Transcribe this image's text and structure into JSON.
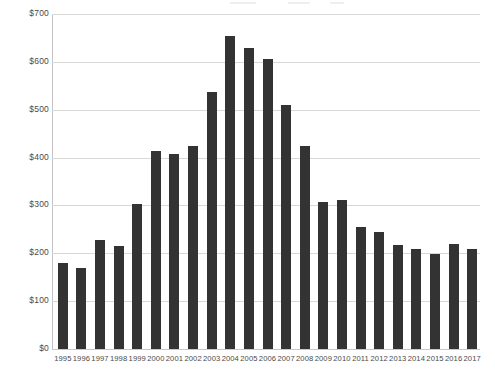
{
  "chart_data": {
    "type": "bar",
    "title": "",
    "subtitle": "",
    "xlabel": "",
    "ylabel": "",
    "ylim": [
      0,
      700
    ],
    "grid": true,
    "legend": null,
    "y_tick_labels": [
      "$700",
      "$600",
      "$500",
      "$400",
      "$300",
      "$200",
      "$100",
      "$0"
    ],
    "y_tick_values": [
      700,
      600,
      500,
      400,
      300,
      200,
      100,
      0
    ],
    "categories": [
      "1995",
      "1996",
      "1997",
      "1998",
      "1999",
      "2000",
      "2001",
      "2002",
      "2003",
      "2004",
      "2005",
      "2006",
      "2007",
      "2008",
      "2009",
      "2010",
      "2011",
      "2012",
      "2013",
      "2014",
      "2015",
      "2016",
      "2017"
    ],
    "values": [
      180,
      170,
      228,
      215,
      303,
      414,
      407,
      424,
      537,
      655,
      629,
      607,
      509,
      424,
      308,
      312,
      254,
      244,
      217,
      210,
      199,
      219,
      210
    ],
    "bar_color": "#333333",
    "gridline_color": "#d8d8d8",
    "axis_color": "#c4c4c4",
    "background_color": "#ffffff"
  }
}
